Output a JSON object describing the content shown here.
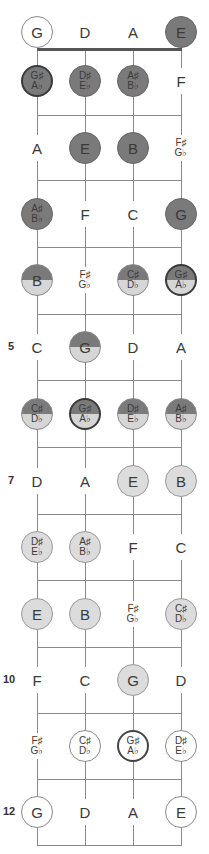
{
  "diagram": {
    "strings": [
      "G",
      "D",
      "A",
      "E"
    ],
    "string_x": [
      37,
      85,
      133,
      181
    ],
    "nut_y": 49,
    "fret_lines_y": [
      115,
      180,
      247,
      314,
      380,
      447,
      514,
      580,
      647,
      713,
      779,
      845
    ],
    "row_y": [
      32,
      81,
      148,
      214,
      280,
      347,
      414,
      481,
      547,
      614,
      680,
      746,
      812
    ],
    "fret_markers": [
      {
        "fret": 5,
        "label": "5"
      },
      {
        "fret": 7,
        "label": "7"
      },
      {
        "fret": 10,
        "label": "10"
      },
      {
        "fret": 12,
        "label": "12"
      }
    ],
    "colors": {
      "dark": "#7a7a7a",
      "light": "#d6d6d6",
      "line": "#8a8a8a",
      "outline": "#3a3a3a"
    },
    "rows": [
      {
        "fret": 0,
        "notes": [
          {
            "n1": "G",
            "n2": "",
            "style": "open"
          },
          {
            "n1": "D",
            "n2": "",
            "style": "plain"
          },
          {
            "n1": "A",
            "n2": "",
            "style": "plain"
          },
          {
            "n1": "E",
            "n2": "",
            "style": "dark"
          }
        ]
      },
      {
        "fret": 1,
        "notes": [
          {
            "n1": "G♯",
            "n2": "A♭",
            "style": "dark-ring"
          },
          {
            "n1": "D♯",
            "n2": "E♭",
            "style": "dark"
          },
          {
            "n1": "A♯",
            "n2": "B♭",
            "style": "dark"
          },
          {
            "n1": "F",
            "n2": "",
            "style": "plain"
          }
        ]
      },
      {
        "fret": 2,
        "notes": [
          {
            "n1": "A",
            "n2": "",
            "style": "plain"
          },
          {
            "n1": "E",
            "n2": "",
            "style": "dark"
          },
          {
            "n1": "B",
            "n2": "",
            "style": "dark"
          },
          {
            "n1": "F♯",
            "n2": "G♭",
            "style": "plain"
          }
        ]
      },
      {
        "fret": 3,
        "notes": [
          {
            "n1": "A♯",
            "n2": "B♭",
            "style": "dark"
          },
          {
            "n1": "F",
            "n2": "",
            "style": "plain"
          },
          {
            "n1": "C",
            "n2": "",
            "style": "plain"
          },
          {
            "n1": "G",
            "n2": "",
            "style": "dark"
          }
        ]
      },
      {
        "fret": 4,
        "notes": [
          {
            "n1": "B",
            "n2": "",
            "style": "half"
          },
          {
            "n1": "F♯",
            "n2": "G♭",
            "style": "plain"
          },
          {
            "n1": "C♯",
            "n2": "D♭",
            "style": "half"
          },
          {
            "n1": "G♯",
            "n2": "A♭",
            "style": "half-ring"
          }
        ]
      },
      {
        "fret": 5,
        "notes": [
          {
            "n1": "C",
            "n2": "",
            "style": "plain"
          },
          {
            "n1": "G",
            "n2": "",
            "style": "half"
          },
          {
            "n1": "D",
            "n2": "",
            "style": "plain"
          },
          {
            "n1": "A",
            "n2": "",
            "style": "plain"
          }
        ]
      },
      {
        "fret": 6,
        "notes": [
          {
            "n1": "C♯",
            "n2": "D♭",
            "style": "half"
          },
          {
            "n1": "G♯",
            "n2": "A♭",
            "style": "half-ring"
          },
          {
            "n1": "D♯",
            "n2": "E♭",
            "style": "half"
          },
          {
            "n1": "A♯",
            "n2": "B♭",
            "style": "half"
          }
        ]
      },
      {
        "fret": 7,
        "notes": [
          {
            "n1": "D",
            "n2": "",
            "style": "plain"
          },
          {
            "n1": "A",
            "n2": "",
            "style": "plain"
          },
          {
            "n1": "E",
            "n2": "",
            "style": "light"
          },
          {
            "n1": "B",
            "n2": "",
            "style": "light"
          }
        ]
      },
      {
        "fret": 8,
        "notes": [
          {
            "n1": "D♯",
            "n2": "E♭",
            "style": "light"
          },
          {
            "n1": "A♯",
            "n2": "B♭",
            "style": "light"
          },
          {
            "n1": "F",
            "n2": "",
            "style": "plain"
          },
          {
            "n1": "C",
            "n2": "",
            "style": "plain"
          }
        ]
      },
      {
        "fret": 9,
        "notes": [
          {
            "n1": "E",
            "n2": "",
            "style": "light"
          },
          {
            "n1": "B",
            "n2": "",
            "style": "light"
          },
          {
            "n1": "F♯",
            "n2": "G♭",
            "style": "plain"
          },
          {
            "n1": "C♯",
            "n2": "D♭",
            "style": "light"
          }
        ]
      },
      {
        "fret": 10,
        "notes": [
          {
            "n1": "F",
            "n2": "",
            "style": "plain"
          },
          {
            "n1": "C",
            "n2": "",
            "style": "plain"
          },
          {
            "n1": "G",
            "n2": "",
            "style": "light"
          },
          {
            "n1": "D",
            "n2": "",
            "style": "plain"
          }
        ]
      },
      {
        "fret": 11,
        "notes": [
          {
            "n1": "F♯",
            "n2": "G♭",
            "style": "plain"
          },
          {
            "n1": "C♯",
            "n2": "D♭",
            "style": "open"
          },
          {
            "n1": "G♯",
            "n2": "A♭",
            "style": "ring"
          },
          {
            "n1": "D♯",
            "n2": "E♭",
            "style": "open"
          }
        ]
      },
      {
        "fret": 12,
        "notes": [
          {
            "n1": "G",
            "n2": "",
            "style": "open"
          },
          {
            "n1": "D",
            "n2": "",
            "style": "plain"
          },
          {
            "n1": "A",
            "n2": "",
            "style": "plain"
          },
          {
            "n1": "E",
            "n2": "",
            "style": "open"
          }
        ]
      }
    ]
  }
}
